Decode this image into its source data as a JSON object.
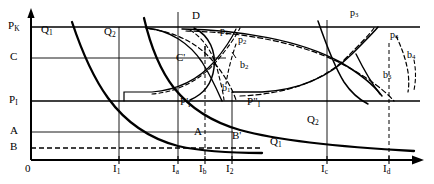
{
  "figure": {
    "type": "economic-diagram",
    "title": "",
    "width": 434,
    "height": 184,
    "background_color": "#ffffff",
    "line_color": "#000000"
  },
  "axes": {
    "y_axis_label": "",
    "x_axis_label": "",
    "origin_label": "0",
    "y_ticks": [
      {
        "key": "PK",
        "label": "P",
        "sub": "K",
        "y": 27
      },
      {
        "key": "C",
        "label": "C",
        "sub": "",
        "y": 58
      },
      {
        "key": "PI",
        "label": "P",
        "sub": "I",
        "y": 101
      },
      {
        "key": "A",
        "label": "A",
        "sub": "",
        "y": 132
      },
      {
        "key": "B",
        "label": "B",
        "sub": "",
        "y": 148
      }
    ],
    "x_ticks": [
      {
        "key": "I1",
        "label": "I",
        "sub": "1",
        "x": 119
      },
      {
        "key": "Ia",
        "label": "I",
        "sub": "a",
        "x": 178
      },
      {
        "key": "Ib",
        "label": "I",
        "sub": "b",
        "x": 205
      },
      {
        "key": "I2",
        "label": "I",
        "sub": "2",
        "x": 232
      },
      {
        "key": "Ic",
        "label": "I",
        "sub": "c",
        "x": 327
      },
      {
        "key": "Id",
        "label": "I",
        "sub": "d",
        "x": 389
      }
    ]
  },
  "curve_labels": [
    {
      "name": "Q1-upper-left",
      "label": "Q",
      "sub": "1",
      "x": 41,
      "y": 24,
      "size": "main"
    },
    {
      "name": "Q2-upper-left",
      "label": "Q",
      "sub": "2",
      "x": 104,
      "y": 26,
      "size": "main"
    },
    {
      "name": "D-top",
      "label": "D",
      "sub": "",
      "x": 192,
      "y": 11,
      "size": "main"
    },
    {
      "name": "C-prime",
      "label": "C",
      "sub": "",
      "x": 176,
      "y": 52,
      "size": "main",
      "prime": "'"
    },
    {
      "name": "p1",
      "label": "p",
      "sub": "1",
      "x": 220,
      "y": 27,
      "size": "pt"
    },
    {
      "name": "p2",
      "label": "p",
      "sub": "2",
      "x": 238,
      "y": 36,
      "size": "pt"
    },
    {
      "name": "b2",
      "label": "b",
      "sub": "2",
      "x": 240,
      "y": 60,
      "size": "pt"
    },
    {
      "name": "b1",
      "label": "b",
      "sub": "1",
      "x": 223,
      "y": 83,
      "size": "pt"
    },
    {
      "name": "p3",
      "label": "p",
      "sub": "3",
      "x": 351,
      "y": 9,
      "size": "pt"
    },
    {
      "name": "p4",
      "label": "p",
      "sub": "4",
      "x": 391,
      "y": 31,
      "size": "pt"
    },
    {
      "name": "b4",
      "label": "b",
      "sub": "4",
      "x": 408,
      "y": 51,
      "size": "pt"
    },
    {
      "name": "b3",
      "label": "b",
      "sub": "3",
      "x": 384,
      "y": 70,
      "size": "pt"
    },
    {
      "name": "PI-prime",
      "label": "P",
      "sub": "I",
      "x": 180,
      "y": 98,
      "size": "main",
      "prime": "'"
    },
    {
      "name": "PI-double-prime",
      "label": "P",
      "sub": "I",
      "x": 249,
      "y": 98,
      "size": "main",
      "prime": "\""
    },
    {
      "name": "A-prime",
      "label": "A",
      "sub": "",
      "x": 194,
      "y": 127,
      "size": "main"
    },
    {
      "name": "B-prime",
      "label": "B",
      "sub": "",
      "x": 232,
      "y": 131,
      "size": "main",
      "prime": "'"
    },
    {
      "name": "Q2-lower-right",
      "label": "Q",
      "sub": "2",
      "x": 308,
      "y": 115,
      "size": "main"
    },
    {
      "name": "Q1-lower-right",
      "label": "Q",
      "sub": "1",
      "x": 271,
      "y": 137,
      "size": "main"
    }
  ],
  "horizontal_lines": [
    {
      "name": "PK-line",
      "y": 27,
      "x_start": 31,
      "x_end": 420,
      "style": "solid",
      "weight": 1.6
    },
    {
      "name": "C-line",
      "y": 58,
      "x_start": 31,
      "x_end": 225,
      "style": "solid",
      "weight": 0.9
    },
    {
      "name": "PI-line",
      "y": 101,
      "x_start": 31,
      "x_end": 420,
      "style": "solid",
      "weight": 1.6
    },
    {
      "name": "A-line",
      "y": 132,
      "x_start": 31,
      "x_end": 232,
      "style": "solid",
      "weight": 0.9
    },
    {
      "name": "B-line",
      "y": 148,
      "x_start": 31,
      "x_end": 260,
      "style": "dashed",
      "weight": 1.2
    }
  ],
  "vertical_lines": [
    {
      "name": "I1-line",
      "x": 119,
      "y_start": 27,
      "y_end": 160,
      "style": "solid",
      "weight": 0.9
    },
    {
      "name": "Ia-line",
      "x": 178,
      "y_start": 12,
      "y_end": 160,
      "style": "solid",
      "weight": 0.9
    },
    {
      "name": "Ib-line",
      "x": 205,
      "y_start": 45,
      "y_end": 160,
      "style": "dashed",
      "weight": 1.0
    },
    {
      "name": "I2-line",
      "x": 232,
      "y_start": 92,
      "y_end": 160,
      "style": "solid",
      "weight": 0.9
    },
    {
      "name": "Ic-line",
      "x": 327,
      "y_start": 20,
      "y_end": 160,
      "style": "solid",
      "weight": 0.9
    },
    {
      "name": "Id-line",
      "x": 389,
      "y_start": 42,
      "y_end": 160,
      "style": "dashed",
      "weight": 1.0
    }
  ],
  "notes": {
    "description": "Two descending demand-type curves Q1 and Q2 on the left, arc/loop curves with dashed companions on the right, bounded by price levels PK, C, PI, A and B."
  }
}
